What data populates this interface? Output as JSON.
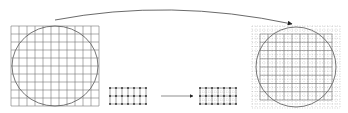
{
  "diagram": {
    "colors": {
      "line": "#555555",
      "grid": "#777777",
      "dashed": "#aaaaaa",
      "background": "#ffffff"
    },
    "left_grid": {
      "x": 11,
      "y": 26,
      "w": 88,
      "h": 80,
      "cols": 11,
      "rows": 10
    },
    "small_grid_left": {
      "x": 110,
      "y": 88,
      "w": 36,
      "h": 16,
      "cols": 6,
      "rows": 2
    },
    "small_grid_right": {
      "x": 200,
      "y": 88,
      "w": 36,
      "h": 16,
      "cols": 6,
      "rows": 2
    },
    "right_grid": {
      "x": 252,
      "y": 26,
      "w": 88,
      "h": 82,
      "cols": 11,
      "rows": 10
    },
    "arrows": [
      {
        "name": "top-curved-arrow",
        "from": [
          55,
          20
        ],
        "to": [
          290,
          22
        ]
      },
      {
        "name": "middle-arrow",
        "from": [
          161,
          96
        ],
        "to": [
          193,
          96
        ]
      }
    ]
  }
}
